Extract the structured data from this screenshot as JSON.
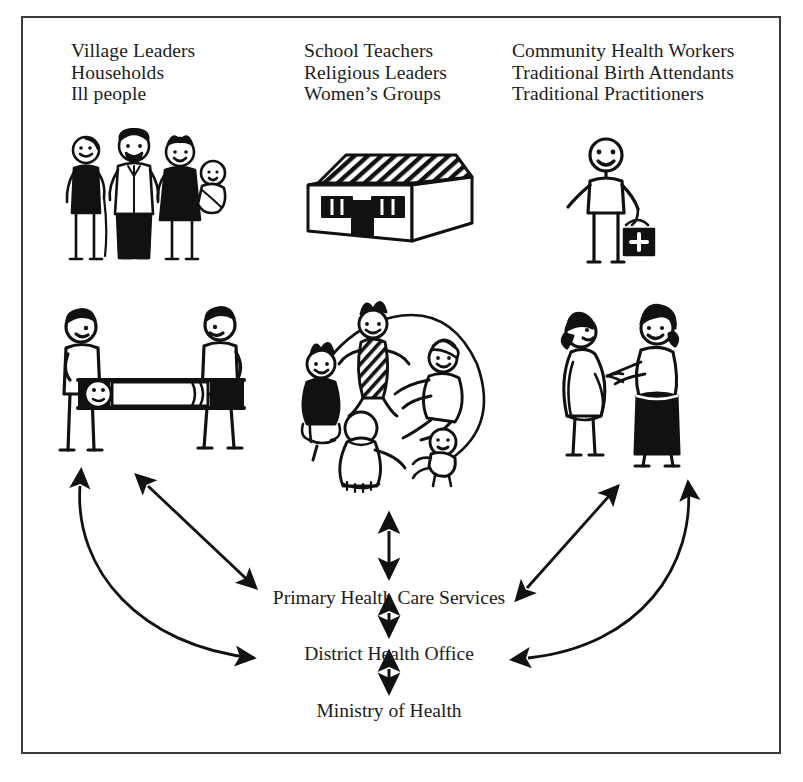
{
  "figure": {
    "type": "diagram",
    "frame_border_color": "#3b3b3b",
    "ink_color": "#1a1a1a",
    "background_color": "#ffffff"
  },
  "columns": [
    {
      "id": "community",
      "lines": [
        "Village Leaders",
        "Households",
        "Ill people"
      ],
      "text": "Village Leaders\nHouseholds\nIll people"
    },
    {
      "id": "social",
      "lines": [
        "School Teachers",
        "Religious Leaders",
        "Women’s Groups"
      ],
      "text": "School Teachers\nReligious Leaders\nWomen’s Groups"
    },
    {
      "id": "providers",
      "lines": [
        "Community Health Workers",
        "Traditional Birth Attendants",
        "Traditional Practitioners"
      ],
      "text": "Community Health Workers\nTraditional Birth Attendants\nTraditional Practitioners"
    }
  ],
  "nodes": [
    {
      "id": "phc",
      "label": "Primary Health Care Services"
    },
    {
      "id": "dho",
      "label": "District Health Office"
    },
    {
      "id": "moh",
      "label": "Ministry of Health"
    }
  ],
  "illustrations": [
    {
      "id": "family",
      "name": "family-group-illustration",
      "caption": "Village family: elder with cane, bearded man, woman with headwrap carrying a baby"
    },
    {
      "id": "school",
      "name": "school-building-illustration",
      "caption": "School building with corrugated roof, two windows and a door"
    },
    {
      "id": "chw",
      "name": "community-health-worker-illustration",
      "caption": "Community health worker carrying a medical kit marked with a cross"
    },
    {
      "id": "stretcher",
      "name": "stretcher-illustration",
      "caption": "Two people carrying an ill person on a stretcher"
    },
    {
      "id": "womens-group",
      "name": "womens-group-illustration",
      "caption": "Women's group seated in a circle with a baby"
    },
    {
      "id": "tba-pair",
      "name": "birth-attendant-illustration",
      "caption": "Traditional birth attendant talking with a pregnant woman"
    }
  ],
  "connectors": [
    {
      "id": "phc-moh-vertical-top",
      "name": "arrow-womens-group-to-phc",
      "style": "double-headed",
      "orientation": "vertical",
      "from": "womens-group",
      "to": "phc"
    },
    {
      "id": "phc-dho-vertical",
      "name": "arrow-phc-to-dho",
      "style": "double-headed",
      "orientation": "vertical",
      "from": "phc",
      "to": "dho"
    },
    {
      "id": "dho-moh-vertical",
      "name": "arrow-dho-to-moh",
      "style": "double-headed",
      "orientation": "vertical",
      "from": "dho",
      "to": "moh"
    },
    {
      "id": "left-diagonal",
      "name": "arrow-stretcher-to-phc",
      "style": "double-headed",
      "orientation": "diagonal",
      "from": "stretcher",
      "to": "phc"
    },
    {
      "id": "left-curve",
      "name": "arrow-dho-to-community",
      "style": "double-headed-curve",
      "orientation": "curve",
      "from": "dho",
      "to": "stretcher"
    },
    {
      "id": "right-diagonal",
      "name": "arrow-phc-to-birth-attendants",
      "style": "double-headed",
      "orientation": "diagonal",
      "from": "phc",
      "to": "tba-pair"
    },
    {
      "id": "right-curve",
      "name": "arrow-dho-to-providers",
      "style": "double-headed-curve",
      "orientation": "curve",
      "from": "dho",
      "to": "tba-pair"
    }
  ]
}
